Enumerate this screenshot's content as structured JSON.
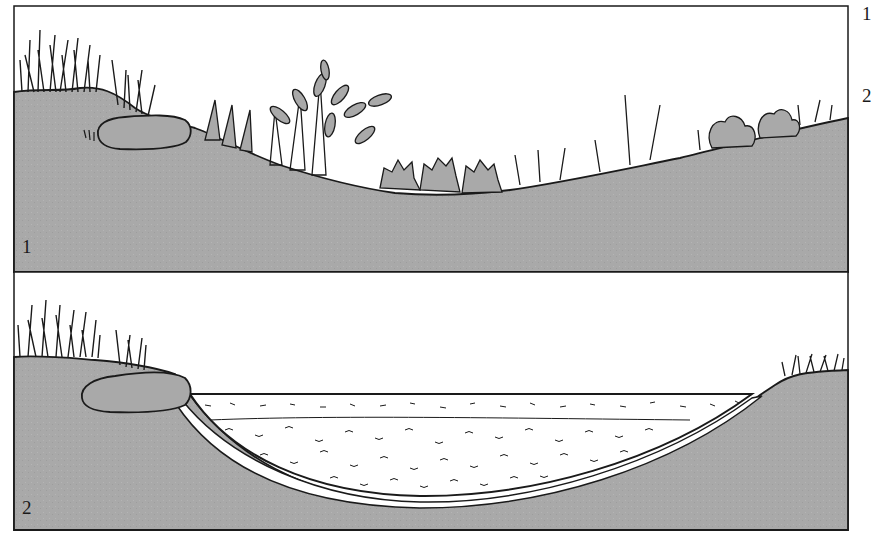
{
  "figure": {
    "panels": [
      {
        "label": "1",
        "description": "Natural depression with grasses, shrubs and a rock on the left bank"
      },
      {
        "label": "2",
        "description": "Excavated basin lined and filled with pond substrate; rock at left edge, grasses on banks"
      }
    ],
    "side_labels": [
      "1",
      "2"
    ],
    "colors": {
      "ground": "#a9a9a9",
      "outline": "#1a1a1a",
      "sky": "#ffffff",
      "liner": "#ffffff"
    }
  }
}
